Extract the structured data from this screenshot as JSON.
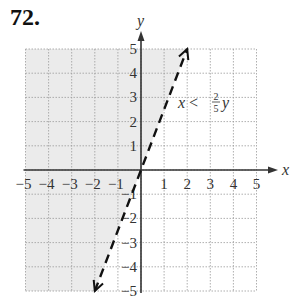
{
  "problem": {
    "number": "72."
  },
  "chart_data": {
    "type": "line",
    "title": "",
    "xlabel": "x",
    "ylabel": "y",
    "xlim": [
      -5,
      5
    ],
    "ylim": [
      -5,
      5
    ],
    "grid": true,
    "x_ticks": [
      "-5",
      "-4",
      "-3",
      "-2",
      "-1",
      "1",
      "2",
      "3",
      "4",
      "5"
    ],
    "y_ticks": [
      "5",
      "4",
      "3",
      "2",
      "1",
      "-1",
      "-2",
      "-3",
      "-4",
      "-5"
    ],
    "series": [
      {
        "name": "boundary x = (2/5)y",
        "style": "dashed",
        "x": [
          -2,
          2
        ],
        "y": [
          -5,
          5
        ],
        "arrows": "both"
      }
    ],
    "shaded_region": "x < (2/5)y (left of boundary)",
    "annotation": {
      "text": "x < ",
      "fraction_num": "2",
      "fraction_den": "5",
      "var": "y"
    },
    "colors": {
      "shade": "#ebebeb",
      "grid": "#9a9a9a",
      "axis": "#333333",
      "line": "#111111"
    }
  }
}
